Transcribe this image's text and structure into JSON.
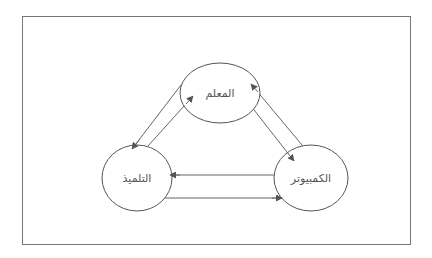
{
  "diagram": {
    "frame": {
      "x": 22,
      "y": 16,
      "width": 388,
      "height": 228,
      "stroke": "#777777"
    },
    "nodes": {
      "teacher": {
        "label": "المعلم",
        "cx": 220,
        "cy": 93,
        "rx": 40,
        "ry": 30
      },
      "student": {
        "label": "التلميذ",
        "cx": 137,
        "cy": 178,
        "rx": 35,
        "ry": 33
      },
      "computer": {
        "label": "الكمبيوتر",
        "cx": 311,
        "cy": 178,
        "rx": 37,
        "ry": 33
      }
    },
    "edges": [
      {
        "from": "teacher",
        "to": "student"
      },
      {
        "from": "student",
        "to": "teacher"
      },
      {
        "from": "teacher",
        "to": "computer"
      },
      {
        "from": "computer",
        "to": "teacher"
      },
      {
        "from": "computer",
        "to": "student"
      },
      {
        "from": "student",
        "to": "computer"
      }
    ],
    "colors": {
      "line": "#666666",
      "node_stroke": "#555555",
      "text": "#555555"
    }
  }
}
